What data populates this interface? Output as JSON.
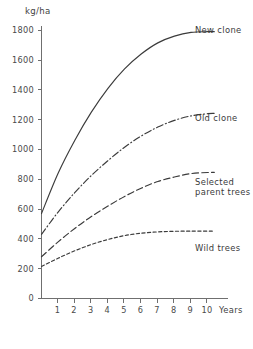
{
  "chart_data": {
    "type": "line",
    "title": "",
    "subtitle": "",
    "xlabel": "Years",
    "ylabel": "kg/ha",
    "ylim": [
      0,
      1800
    ],
    "xlim": [
      0,
      10.4
    ],
    "grid": false,
    "legend_position": "inline-right-of-curve-end",
    "y_ticks": [
      0,
      200,
      400,
      600,
      800,
      1000,
      1200,
      1400,
      1600,
      1800
    ],
    "y_tick_labels": [
      "0",
      "200",
      "400",
      "600",
      "800",
      "1000",
      "1200",
      "1400",
      "1600",
      "1800"
    ],
    "x_ticks": [
      1,
      2,
      3,
      4,
      5,
      6,
      7,
      8,
      9,
      10
    ],
    "x_tick_labels": [
      "1",
      "2",
      "3",
      "4",
      "5",
      "6",
      "7",
      "8",
      "9",
      "10"
    ],
    "x": [
      0,
      1,
      2,
      3,
      4,
      5,
      6,
      7,
      8,
      9,
      10,
      10.4
    ],
    "series": [
      {
        "name": "New clone",
        "style": "solid",
        "values": [
          570,
          840,
          1060,
          1250,
          1410,
          1540,
          1640,
          1715,
          1760,
          1785,
          1790,
          1790
        ]
      },
      {
        "name": "Old clone",
        "style": "dash-dot",
        "values": [
          430,
          580,
          710,
          825,
          925,
          1015,
          1090,
          1150,
          1195,
          1225,
          1240,
          1242
        ]
      },
      {
        "name": "Selected parent trees",
        "style": "dashed",
        "values": [
          280,
          380,
          470,
          550,
          620,
          685,
          740,
          785,
          815,
          838,
          845,
          846
        ]
      },
      {
        "name": "Wild trees",
        "style": "short-dashed",
        "values": [
          215,
          270,
          320,
          362,
          396,
          422,
          438,
          447,
          451,
          452,
          452,
          452
        ]
      }
    ],
    "annotations": [
      {
        "text": "New clone",
        "series": "New clone"
      },
      {
        "text": "Old clone",
        "series": "Old clone"
      },
      {
        "text": "Selected",
        "series": "Selected parent trees"
      },
      {
        "text": "parent trees",
        "series": "Selected parent trees"
      },
      {
        "text": "Wild trees",
        "series": "Wild trees"
      }
    ]
  },
  "labels": {
    "y_unit": "kg/ha",
    "x_axis_name": "Years",
    "series_new_clone": "New clone",
    "series_old_clone": "Old clone",
    "series_selected_line1": "Selected",
    "series_selected_line2": "parent trees",
    "series_wild_trees": "Wild trees"
  },
  "y_ticks": {
    "t0": "0",
    "t1": "200",
    "t2": "400",
    "t3": "600",
    "t4": "800",
    "t5": "1000",
    "t6": "1200",
    "t7": "1400",
    "t8": "1600",
    "t9": "1800"
  },
  "x_ticks": {
    "t1": "1",
    "t2": "2",
    "t3": "3",
    "t4": "4",
    "t5": "5",
    "t6": "6",
    "t7": "7",
    "t8": "8",
    "t9": "9",
    "t10": "10"
  },
  "colors": {
    "ink": "#3a3a3a",
    "axis": "#6f6f6f",
    "background": "#ffffff"
  }
}
